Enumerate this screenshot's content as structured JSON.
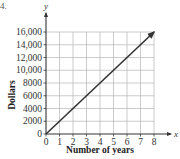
{
  "problem_number": "4.",
  "chart_data": {
    "type": "line",
    "title": "",
    "xlabel": "Number of years",
    "ylabel": "Dollars",
    "x_axis_variable": "x",
    "y_axis_variable": "y",
    "xlim": [
      0,
      8
    ],
    "ylim": [
      0,
      16000
    ],
    "grid": true,
    "x_ticks": [
      0,
      1,
      2,
      3,
      4,
      5,
      6,
      7,
      8
    ],
    "y_ticks": [
      0,
      2000,
      4000,
      6000,
      8000,
      10000,
      12000,
      14000,
      16000
    ],
    "y_tick_labels": [
      "0",
      "2000",
      "4000",
      "6000",
      "8000",
      "10,000",
      "12,000",
      "14,000",
      "16,000"
    ],
    "series": [
      {
        "name": "Dollars vs years",
        "x": [
          0,
          1,
          2,
          3,
          4,
          5,
          6,
          7,
          8
        ],
        "y": [
          0,
          2000,
          4000,
          6000,
          8000,
          10000,
          12000,
          14000,
          16000
        ],
        "arrow_at_end": true,
        "color": "#333333"
      }
    ],
    "legend": null
  },
  "colors": {
    "grid": "#b5b5b5",
    "axis": "#333333",
    "line": "#333333"
  }
}
